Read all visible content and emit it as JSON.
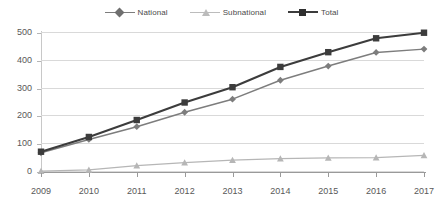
{
  "chart_data": {
    "type": "line",
    "title": "",
    "subtitle": "",
    "xlabel": "",
    "ylabel": "",
    "categories": [
      "2009",
      "2010",
      "2011",
      "2012",
      "2013",
      "2014",
      "2015",
      "2016",
      "2017"
    ],
    "x": [
      2009,
      2010,
      2011,
      2012,
      2013,
      2014,
      2015,
      2016,
      2017
    ],
    "series": [
      {
        "name": "National",
        "color": "#7d7d7d",
        "marker": "diamond",
        "values": [
          69,
          117,
          163,
          215,
          262,
          330,
          381,
          430,
          442
        ]
      },
      {
        "name": "Subnational",
        "color": "#b6b6b6",
        "marker": "triangle",
        "values": [
          3,
          8,
          23,
          34,
          43,
          48,
          51,
          52,
          60
        ]
      },
      {
        "name": "Total",
        "color": "#3c3c3c",
        "marker": "square",
        "values": [
          73,
          126,
          187,
          250,
          305,
          378,
          431,
          481,
          501
        ]
      }
    ],
    "ylim": [
      0,
      500
    ],
    "yticks": [
      0,
      100,
      200,
      300,
      400,
      500
    ],
    "ytick_labels": [
      "0",
      "100",
      "200",
      "300",
      "400",
      "500"
    ],
    "xtick_labels": [
      "2009",
      "2010",
      "2011",
      "2012",
      "2013",
      "2014",
      "2015",
      "2016",
      "2017"
    ],
    "grid": "horizontal",
    "legend_position": "top-center",
    "annotations": []
  },
  "legend": {
    "items": [
      {
        "label": "National",
        "color": "#7d7d7d",
        "marker": "diamond"
      },
      {
        "label": "Subnational",
        "color": "#b6b6b6",
        "marker": "triangle"
      },
      {
        "label": "Total",
        "color": "#3c3c3c",
        "marker": "square"
      }
    ]
  },
  "axes": {
    "y_tick_labels": [
      "500",
      "400",
      "300",
      "200",
      "100",
      "0"
    ],
    "x_tick_labels": [
      "2009",
      "2010",
      "2011",
      "2012",
      "2013",
      "2014",
      "2015",
      "2016",
      "2017"
    ]
  },
  "colors": {
    "gridline": "#d9d9d9",
    "axis": "#9a9a9a",
    "text": "#585858",
    "background": "#ffffff"
  }
}
